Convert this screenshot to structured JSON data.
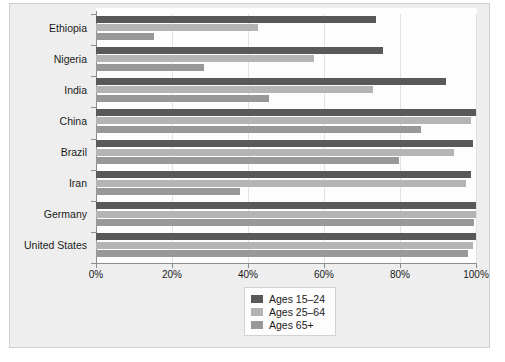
{
  "chart_data": {
    "type": "bar",
    "orientation": "horizontal",
    "title": "",
    "subtitle": "",
    "xlabel": "",
    "ylabel": "",
    "xlim": [
      0,
      100
    ],
    "xticks": [
      0,
      20,
      40,
      60,
      80,
      100
    ],
    "xtick_labels": [
      "0%",
      "20%",
      "40%",
      "60%",
      "80%",
      "100%"
    ],
    "grid": true,
    "grid_axis": "x",
    "legend_position": "bottom-center",
    "categories": [
      "Ethiopia",
      "Nigeria",
      "India",
      "China",
      "Brazil",
      "Iran",
      "Germany",
      "United States"
    ],
    "series": [
      {
        "name": "Ages 15–24",
        "color": "#595959",
        "values": [
          73.6,
          75.4,
          92.1,
          100.0,
          99.2,
          98.7,
          100.0,
          100.0
        ]
      },
      {
        "name": "Ages 25–64",
        "color": "#b4b4b4",
        "values": [
          42.5,
          57.3,
          72.8,
          98.6,
          94.2,
          97.4,
          100.0,
          99.2
        ]
      },
      {
        "name": "Ages 65+",
        "color": "#989898",
        "values": [
          15.3,
          28.3,
          45.4,
          85.4,
          79.7,
          38.0,
          99.4,
          98.0
        ]
      }
    ]
  },
  "legend": {
    "entries": [
      {
        "label": "Ages 15–24",
        "color": "#595959",
        "swatch_name": "legend-swatch-ages-15-24"
      },
      {
        "label": "Ages 25–64",
        "color": "#b4b4b4",
        "swatch_name": "legend-swatch-ages-25-64"
      },
      {
        "label": "Ages 65+",
        "color": "#989898",
        "swatch_name": "legend-swatch-ages-65-plus"
      }
    ]
  },
  "colors": {
    "page_background": "#ffffff",
    "card_background": "#eeeeee",
    "plot_background": "#fdfdfd",
    "axis": "#8d8d8d",
    "gridline": "#e2e2e2",
    "text": "#1a1a1a"
  }
}
